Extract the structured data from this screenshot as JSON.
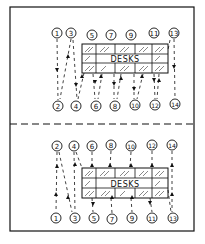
{
  "diagram": {
    "title": "",
    "panels": [
      {
        "name": "top-panel",
        "desk_label": "DESKS",
        "top_nodes": [
          "1",
          "3",
          "5",
          "7",
          "9",
          "11",
          "13"
        ],
        "bottom_nodes": [
          "2",
          "4",
          "6",
          "8",
          "10",
          "12",
          "14"
        ]
      },
      {
        "name": "bottom-panel",
        "desk_label": "DESKS",
        "top_nodes": [
          "2",
          "4",
          "6",
          "8",
          "10",
          "12",
          "14"
        ],
        "bottom_nodes": [
          "1",
          "3",
          "5",
          "7",
          "9",
          "11",
          "13"
        ]
      }
    ],
    "colors": {
      "ink": "#111111",
      "background": "#ffffff"
    }
  }
}
